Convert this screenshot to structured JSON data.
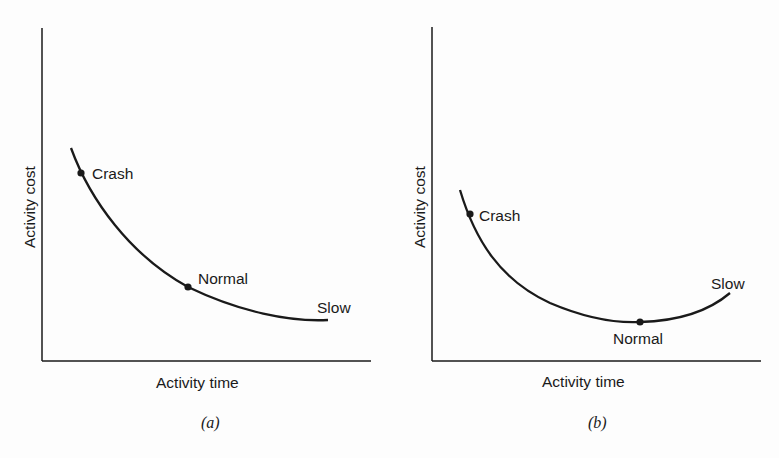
{
  "panels": [
    {
      "caption": "(a)",
      "ylabel": "Activity cost",
      "xlabel": "Activity time",
      "points": {
        "crash": "Crash",
        "normal": "Normal",
        "slow": "Slow"
      }
    },
    {
      "caption": "(b)",
      "ylabel": "Activity cost",
      "xlabel": "Activity time",
      "points": {
        "crash": "Crash",
        "normal": "Normal",
        "slow": "Slow"
      }
    }
  ],
  "colors": {
    "ink": "#1a1a1a",
    "background": "#fdfdfd"
  }
}
